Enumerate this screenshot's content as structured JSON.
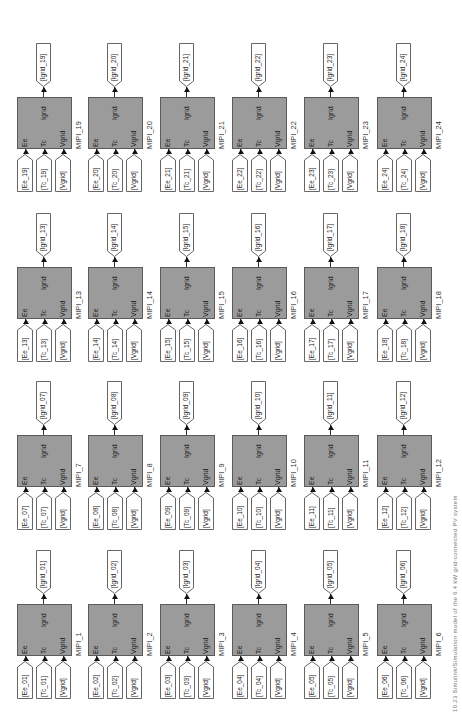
{
  "figure": {
    "caption": "10.23 Simulink/Simulation model of the 6.4 kW grid-connected PV system",
    "orientation": "rotated 90° counter-clockwise",
    "block_fill": "#9b9b9b",
    "block_border": "#5a5a5a"
  },
  "port_labels": {
    "in1": "Ee",
    "in2": "Tc",
    "in3": "Vgrid",
    "out": "Igrid"
  },
  "blocks": [
    {
      "name": "MIPI_1",
      "in": [
        "[Ee_01]",
        "[Tc_01]",
        "[Vgrid]"
      ],
      "out": "[Igrid_01]"
    },
    {
      "name": "MIPI_2",
      "in": [
        "[Ee_02]",
        "[Tc_02]",
        "[Vgrid]"
      ],
      "out": "[Igrid_02]"
    },
    {
      "name": "MIPI_3",
      "in": [
        "[Ee_03]",
        "[Tc_03]",
        "[Vgrid]"
      ],
      "out": "[Igrid_03]"
    },
    {
      "name": "MIPI_4",
      "in": [
        "[Ee_04]",
        "[Tc_04]",
        "[Vgrid]"
      ],
      "out": "[Igrid_04]"
    },
    {
      "name": "MIPI_5",
      "in": [
        "[Ee_05]",
        "[Tc_05]",
        "[Vgrid]"
      ],
      "out": "[Igrid_05]"
    },
    {
      "name": "MIPI_6",
      "in": [
        "[Ee_06]",
        "[Tc_06]",
        "[Vgrid]"
      ],
      "out": "[Igrid_06]"
    },
    {
      "name": "MIPI_7",
      "in": [
        "[Ee_07]",
        "[Tc_07]",
        "[Vgrid]"
      ],
      "out": "[Igrid_07]"
    },
    {
      "name": "MIPI_8",
      "in": [
        "[Ee_08]",
        "[Tc_08]",
        "[Vgrid]"
      ],
      "out": "[Igrid_08]"
    },
    {
      "name": "MIPI_9",
      "in": [
        "[Ee_09]",
        "[Tc_09]",
        "[Vgrid]"
      ],
      "out": "[Igrid_09]"
    },
    {
      "name": "MIPI_10",
      "in": [
        "[Ee_10]",
        "[Tc_10]",
        "[Vgrid]"
      ],
      "out": "[Igrid_10]"
    },
    {
      "name": "MIPI_11",
      "in": [
        "[Ee_11]",
        "[Tc_11]",
        "[Vgrid]"
      ],
      "out": "[Igrid_11]"
    },
    {
      "name": "MIPI_12",
      "in": [
        "[Ee_12]",
        "[Tc_12]",
        "[Vgrid]"
      ],
      "out": "[Igrid_12]"
    },
    {
      "name": "MIPI_13",
      "in": [
        "[Ee_13]",
        "[Tc_13]",
        "[Vgrid]"
      ],
      "out": "[Igrid_13]"
    },
    {
      "name": "MIPI_14",
      "in": [
        "[Ee_14]",
        "[Tc_14]",
        "[Vgrid]"
      ],
      "out": "[Igrid_14]"
    },
    {
      "name": "MIPI_15",
      "in": [
        "[Ee_15]",
        "[Tc_15]",
        "[Vgrid]"
      ],
      "out": "[Igrid_15]"
    },
    {
      "name": "MIPI_16",
      "in": [
        "[Ee_16]",
        "[Tc_16]",
        "[Vgrid]"
      ],
      "out": "[Igrid_16]"
    },
    {
      "name": "MIPI_17",
      "in": [
        "[Ee_17]",
        "[Tc_17]",
        "[Vgrid]"
      ],
      "out": "[Igrid_17]"
    },
    {
      "name": "MIPI_18",
      "in": [
        "[Ee_18]",
        "[Tc_18]",
        "[Vgrid]"
      ],
      "out": "[Igrid_18]"
    },
    {
      "name": "MIPI_19",
      "in": [
        "[Ee_19]",
        "[Tc_19]",
        "[Vgrid]"
      ],
      "out": "[Igrid_19]"
    },
    {
      "name": "MIPI_20",
      "in": [
        "[Ee_20]",
        "[Tc_20]",
        "[Vgrid]"
      ],
      "out": "[Igrid_20]"
    },
    {
      "name": "MIPI_21",
      "in": [
        "[Ee_21]",
        "[Tc_21]",
        "[Vgrid]"
      ],
      "out": "[Igrid_21]"
    },
    {
      "name": "MIPI_22",
      "in": [
        "[Ee_22]",
        "[Tc_22]",
        "[Vgrid]"
      ],
      "out": "[Igrid_22]"
    },
    {
      "name": "MIPI_23",
      "in": [
        "[Ee_23]",
        "[Tc_23]",
        "[Vgrid]"
      ],
      "out": "[Igrid_23]"
    },
    {
      "name": "MIPI_24",
      "in": [
        "[Ee_24]",
        "[Tc_24]",
        "[Vgrid]"
      ],
      "out": "[Igrid_24]"
    }
  ],
  "layout": {
    "col_x": [
      17,
      88,
      160,
      232,
      304,
      377
    ],
    "row_block_y": [
      604,
      435,
      267,
      97
    ],
    "rows": [
      [
        0,
        1,
        2,
        3,
        4,
        5
      ],
      [
        6,
        7,
        8,
        9,
        10,
        11
      ],
      [
        12,
        13,
        14,
        15,
        16,
        17
      ],
      [
        18,
        19,
        20,
        21,
        22,
        23
      ]
    ]
  }
}
